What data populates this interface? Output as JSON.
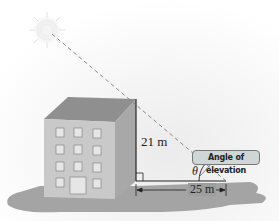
{
  "diagram": {
    "type": "right-triangle angle-of-elevation illustration",
    "labels": {
      "height": "21 m",
      "distance": "25 m",
      "angle": "θ",
      "callout": "Angle of elevation"
    },
    "elements": [
      "sun",
      "building",
      "dashed sight line",
      "right-angle marker",
      "ground shadow"
    ],
    "colors": {
      "shadow": "#9e9e9e",
      "building_front": "#c9c9c9",
      "building_side": "#a8a8a8",
      "roof": "#8f8f8f",
      "callout_bg": "#cfd6d6",
      "sun": "#f3f3f3"
    }
  }
}
